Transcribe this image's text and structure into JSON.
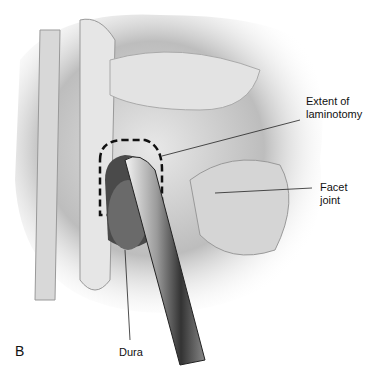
{
  "figure": {
    "panel_label": "B",
    "labels": {
      "extent_line1": "Extent of",
      "extent_line2": "laminotomy",
      "facet": "Facet joint",
      "dura": "Dura"
    }
  }
}
